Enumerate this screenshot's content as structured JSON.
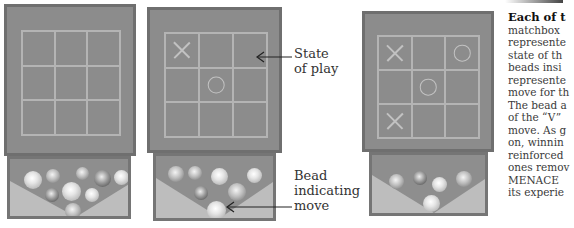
{
  "figure": {
    "panels": [
      {
        "id": "empty-board",
        "board": [
          "",
          "",
          "",
          "",
          "",
          "",
          "",
          "",
          ""
        ],
        "beads": [
          "mid",
          "mid",
          "mid",
          "dark",
          "light",
          "dark",
          "light",
          "light",
          "mid"
        ]
      },
      {
        "id": "state-of-play",
        "board": [
          "X",
          "",
          "",
          "",
          "O",
          "",
          "",
          "",
          ""
        ],
        "beads": [
          "mid",
          "mid",
          "light",
          "light",
          "dark",
          "mid",
          "light"
        ]
      },
      {
        "id": "later-state",
        "board": [
          "X",
          "",
          "O",
          "",
          "O",
          "",
          "X",
          "",
          ""
        ],
        "beads": [
          "mid",
          "dark",
          "light",
          "mid",
          "light"
        ]
      }
    ],
    "annotations": {
      "state_label_line1": "State",
      "state_label_line2": "of play",
      "bead_label_line1": "Bead",
      "bead_label_line2": "indicating",
      "bead_label_line3": "move"
    },
    "caption": {
      "heading": "Each of t",
      "lines": [
        "matchbox",
        "represente",
        "state of th",
        "beads insi",
        "represente",
        "move for th",
        "The bead a",
        "of the “V”",
        "move. As g",
        "on, winnin",
        "reinforced",
        "ones remov",
        "MENACE",
        "its experie"
      ]
    }
  }
}
